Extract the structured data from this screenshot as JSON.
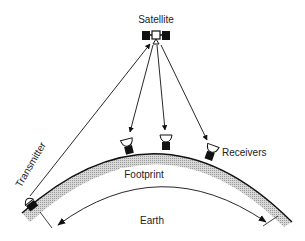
{
  "diagram": {
    "type": "satellite-broadcast",
    "labels": {
      "satellite": "Satellite",
      "transmitter": "Transmitter",
      "receivers": "Receivers",
      "footprint": "Footprint",
      "earth": "Earth"
    },
    "nodes": [
      {
        "id": "satellite",
        "role": "relay",
        "x": 156,
        "y": 36
      },
      {
        "id": "transmitter",
        "role": "uplink",
        "x": 26,
        "y": 200
      },
      {
        "id": "receiver-1",
        "role": "downlink",
        "x": 128,
        "y": 147
      },
      {
        "id": "receiver-2",
        "role": "downlink",
        "x": 166,
        "y": 143
      },
      {
        "id": "receiver-3",
        "role": "downlink",
        "x": 210,
        "y": 153
      }
    ],
    "edges": [
      {
        "from": "transmitter",
        "to": "satellite",
        "arrow": "to"
      },
      {
        "from": "satellite",
        "to": "receiver-1",
        "arrow": "to"
      },
      {
        "from": "satellite",
        "to": "receiver-2",
        "arrow": "to"
      },
      {
        "from": "satellite",
        "to": "receiver-3",
        "arrow": "to"
      }
    ],
    "colors": {
      "ink": "#111111",
      "earth_band": "#bdbdbd",
      "background": "#ffffff"
    }
  }
}
